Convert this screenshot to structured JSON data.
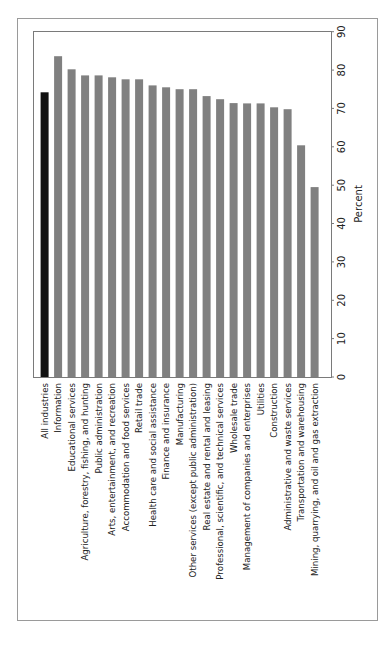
{
  "chart_data": {
    "type": "bar",
    "orientation": "rotated-90 (vertical bars, labels read bottom-to-top, value axis on right)",
    "title": "",
    "xlabel": "",
    "ylabel": "Percent",
    "ylim": [
      0,
      90
    ],
    "yticks": [
      0,
      10,
      20,
      30,
      40,
      50,
      60,
      70,
      80,
      90
    ],
    "grid": false,
    "legend": null,
    "highlight": {
      "category": "All industries",
      "color": "#111111"
    },
    "bar_color": "#808080",
    "categories": [
      "All industries",
      "Information",
      "Educational services",
      "Agriculture, forestry, fishing, and hunting",
      "Public administration",
      "Arts, entertainment, and recreation",
      "Accommodation and food services",
      "Retail trade",
      "Health care and social assistance",
      "Finance and insurance",
      "Manufacturing",
      "Other services (except public administration)",
      "Real estate and rental and leasing",
      "Professional, scientific, and technical services",
      "Wholesale trade",
      "Management of companies and enterprises",
      "Utilities",
      "Construction",
      "Administrative and waste services",
      "Transportation and warehousing",
      "Mining, quarrying, and oil and gas extraction"
    ],
    "values": [
      74.2,
      83.6,
      80.2,
      78.6,
      78.6,
      78.1,
      77.6,
      77.6,
      76.0,
      75.5,
      75.0,
      75.0,
      73.2,
      72.4,
      71.4,
      71.3,
      71.3,
      70.3,
      69.8,
      60.4,
      49.5
    ]
  },
  "axis": {
    "title": "Percent",
    "ticks": [
      "0",
      "10",
      "20",
      "30",
      "40",
      "50",
      "60",
      "70",
      "80",
      "90"
    ]
  }
}
